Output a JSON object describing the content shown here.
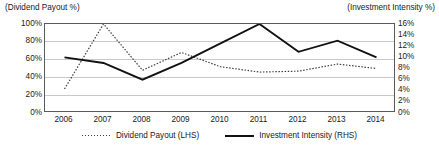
{
  "chart_data": {
    "type": "line",
    "title": "",
    "categories": [
      "2006",
      "2007",
      "2008",
      "2009",
      "2010",
      "2011",
      "2012",
      "2013",
      "2014"
    ],
    "series": [
      {
        "name": "Dividend Payout (LHS)",
        "axis": "left",
        "style": "dotted",
        "color": "#3f3f3f",
        "values": [
          27,
          100,
          48,
          68,
          52,
          46,
          47,
          55,
          50
        ]
      },
      {
        "name": "Investment Intensity (RHS)",
        "axis": "right",
        "style": "solid",
        "color": "#111111",
        "values": [
          10,
          9,
          6,
          9,
          12.5,
          16,
          11,
          13,
          10
        ]
      }
    ],
    "left_axis": {
      "caption": "(Dividend Payout %)",
      "ticks": [
        "100%",
        "80%",
        "60%",
        "40%",
        "20%",
        "0%"
      ],
      "tick_values": [
        100,
        80,
        60,
        40,
        20,
        0
      ],
      "min": 0,
      "max": 100
    },
    "right_axis": {
      "caption": "(Investment Intensity %)",
      "ticks": [
        "16%",
        "14%",
        "12%",
        "10%",
        "8%",
        "6%",
        "4%",
        "2%",
        "0%"
      ],
      "tick_values": [
        16,
        14,
        12,
        10,
        8,
        6,
        4,
        2,
        0
      ],
      "min": 0,
      "max": 16
    },
    "xlabel": "",
    "ylabel": "",
    "grid": true,
    "legend_position": "bottom",
    "legend": [
      "Dividend Payout (LHS)",
      "Investment Intensity (RHS)"
    ]
  }
}
